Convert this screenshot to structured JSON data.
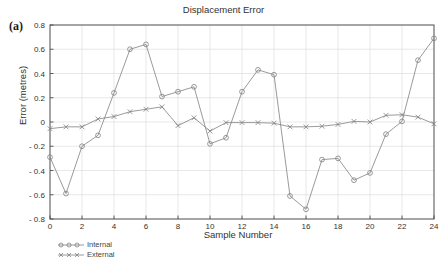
{
  "panel": {
    "label": "(a)"
  },
  "chart_data": {
    "type": "line",
    "title": "Displacement Error",
    "xlabel": "Sample Number",
    "ylabel": "Error (metres)",
    "xlim": [
      0,
      24
    ],
    "ylim": [
      -0.8,
      0.8
    ],
    "xticks": [
      0,
      2,
      4,
      6,
      8,
      10,
      12,
      14,
      16,
      18,
      20,
      22,
      24
    ],
    "xtick_labels": [
      "0",
      "2",
      "4",
      "6",
      "8",
      "10",
      "12",
      "14",
      "16",
      "18",
      "20",
      "22",
      "24"
    ],
    "yticks": [
      -0.8,
      -0.6,
      -0.4,
      -0.2,
      0,
      0.2,
      0.4,
      0.6,
      0.8
    ],
    "ytick_labels": [
      "- 0.8",
      "- 0.6",
      "- 0.4",
      "- 0.2",
      "0",
      "0.2",
      "0.4",
      "0.6",
      "0.8"
    ],
    "grid": true,
    "legend_position": "below-left",
    "x": [
      0,
      1,
      2,
      3,
      4,
      5,
      6,
      7,
      8,
      9,
      10,
      11,
      12,
      13,
      14,
      15,
      16,
      17,
      18,
      19,
      20,
      21,
      22,
      23,
      24
    ],
    "series": [
      {
        "name": "Internal",
        "marker": "circle",
        "color": "#808080",
        "values": [
          -0.29,
          -0.59,
          -0.2,
          -0.11,
          0.24,
          0.6,
          0.64,
          0.21,
          0.25,
          0.29,
          -0.18,
          -0.13,
          0.25,
          0.43,
          0.39,
          -0.61,
          -0.72,
          -0.31,
          -0.3,
          -0.48,
          -0.42,
          -0.1,
          0.005,
          0.51,
          0.69
        ]
      },
      {
        "name": "External",
        "marker": "x",
        "color": "#808080",
        "values": [
          -0.055,
          -0.04,
          -0.04,
          0.025,
          0.045,
          0.085,
          0.105,
          0.125,
          -0.03,
          0.035,
          -0.075,
          -0.005,
          -0.005,
          -0.005,
          -0.01,
          -0.04,
          -0.04,
          -0.035,
          -0.02,
          0.005,
          0.0,
          0.055,
          0.06,
          0.04,
          -0.015
        ]
      }
    ]
  },
  "legend": {
    "items": [
      {
        "label": "Internal",
        "marker": "circle"
      },
      {
        "label": "External",
        "marker": "x"
      }
    ]
  },
  "colors": {
    "line": "#808080",
    "grid": "#d9d9d9",
    "frame": "#4d4d4d",
    "text": "#333333"
  }
}
